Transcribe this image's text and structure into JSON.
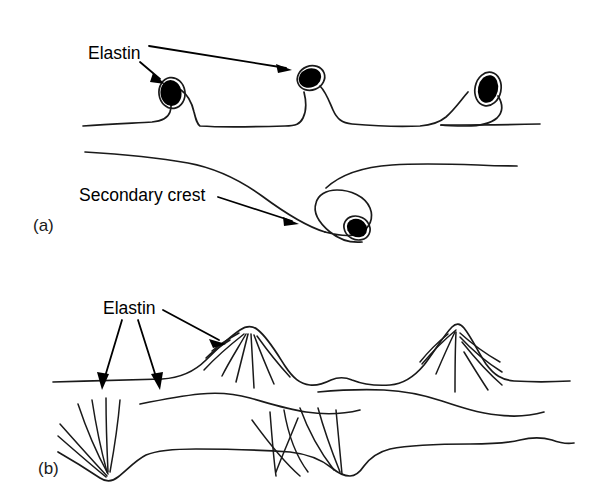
{
  "figure": {
    "background_color": "#ffffff",
    "ink_color": "#1a1a1a",
    "blob_color": "#000000",
    "width": 593,
    "height": 491
  },
  "panels": [
    {
      "id": "a",
      "label": "(a)",
      "label_x": 33,
      "label_y": 227,
      "annotations": [
        {
          "id": "elastin-a",
          "text": "Elastin",
          "text_x": 88,
          "text_y": 54
        },
        {
          "id": "secondary-crest-a",
          "text": "Secondary crest",
          "text_x": 79,
          "text_y": 196
        }
      ],
      "elastin_blobs": 4,
      "secondary_crests": 1
    },
    {
      "id": "b",
      "label": "(b)",
      "label_x": 38,
      "label_y": 470,
      "annotations": [
        {
          "id": "elastin-b",
          "text": "Elastin",
          "text_x": 103,
          "text_y": 309
        }
      ],
      "crest_peaks": 2,
      "troughs": 2,
      "arrow_count": 3
    }
  ],
  "labels": {
    "elastin": "Elastin",
    "secondary_crest": "Secondary crest",
    "panel_a": "(a)",
    "panel_b": "(b)"
  }
}
